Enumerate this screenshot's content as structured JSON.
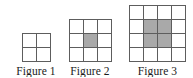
{
  "panel": {
    "background_color": "#ffffff",
    "grid_line_color": "#5d5d5d",
    "shaded_cell_color": "#a9a9a9",
    "label_color": "#1a1a1a"
  },
  "figures": [
    {
      "id": "figure-1",
      "label": "Figure 1",
      "rows": 2,
      "cols": 2,
      "total_cells": 4,
      "shaded_cells": 0,
      "shaded_positions": []
    },
    {
      "id": "figure-2",
      "label": "Figure 2",
      "rows": 3,
      "cols": 3,
      "total_cells": 9,
      "shaded_cells": 1,
      "shaded_positions": [
        [
          2,
          2
        ]
      ]
    },
    {
      "id": "figure-3",
      "label": "Figure 3",
      "rows": 4,
      "cols": 4,
      "total_cells": 16,
      "shaded_cells": 4,
      "shaded_positions": [
        [
          2,
          2
        ],
        [
          2,
          3
        ],
        [
          3,
          2
        ],
        [
          3,
          3
        ]
      ]
    }
  ]
}
